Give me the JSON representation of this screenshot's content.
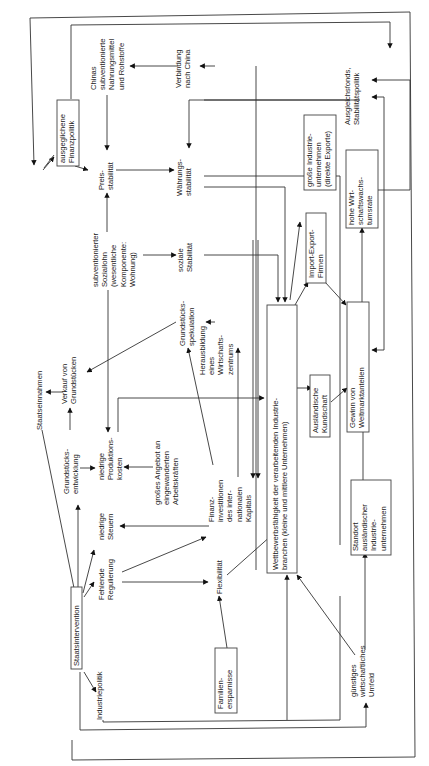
{
  "diagram": {
    "orientation": "rotated-90-ccw",
    "nodes": {
      "staatsintervention": [
        "Staatsintervention"
      ],
      "industriepolitik": [
        "Industriepolitik"
      ],
      "fehlende_regulierung": [
        "Fehlende",
        "Regulierung"
      ],
      "niedrige_steuern": [
        "niedrige",
        "Steuern"
      ],
      "grundstuecksentwicklung": [
        "Grundstücks-",
        "entwicklung"
      ],
      "staatseinnahmen": [
        "Staatseinnahmen"
      ],
      "verkauf_grundstuecke": [
        "Verkauf von",
        "Grundstücken"
      ],
      "niedrige_produktionskosten": [
        "niedrige",
        "Produktions-",
        "kosten"
      ],
      "ausgeglichene_finanzpolitik": [
        "ausgeglichene",
        "Finanzpolitik"
      ],
      "chinas_subventioniert": [
        "Chinas",
        "subventionierte",
        "Nahrungsmittel",
        "und Rohstoffe"
      ],
      "preisstabilitaet": [
        "Preis-",
        "stabilität"
      ],
      "subventionierter_soziallohn": [
        "subventionierter",
        "Soziallohn",
        "(wesentliche",
        "Komponente:",
        "Wohnung)"
      ],
      "grosses_angebot": [
        "großes Angebot an",
        "eingewanderten",
        "Arbeitskräften"
      ],
      "familienersparnisse": [
        "Familien-",
        "ersparnisse"
      ],
      "flexibilitaet": [
        "Flexibilität"
      ],
      "finanzinvestitionen": [
        "Finanz-",
        "investitionen",
        "des inter-",
        "nationalen",
        "Kapitals"
      ],
      "grundstuecksspekulation": [
        "Grundstücks-",
        "spekulation"
      ],
      "herausbildung": [
        "Herausbildung",
        "eines",
        "Wirtschafts-",
        "zentrums"
      ],
      "soziale_stabilitaet": [
        "soziale",
        "Stabilität"
      ],
      "verbindung_china": [
        "Verbindung",
        "nach China"
      ],
      "waehrungsstabilitaet": [
        "Währungs-",
        "stabilität"
      ],
      "wettbewerbsfaehigkeit": [
        "Wettbewerbsfähigkeit der verarbeitenden Industrie-",
        "branchen (kleine und mittlere Unternehmen)"
      ],
      "auslaendische_kundschaft": [
        "Ausländische",
        "Kundschaft"
      ],
      "import_export": [
        "Import-Export-",
        "Firmen"
      ],
      "grosse_industrie": [
        "große Industrie-",
        "unternehmen",
        "(direkte Exporte)"
      ],
      "gewinn_weltmarkt": [
        "Gewinn von",
        "Weltmarktanteilen"
      ],
      "hohe_wachstumsrate": [
        "hohe Wirt-",
        "schaftswachs-",
        "tumsrate"
      ],
      "ausgleichsfonds": [
        "Ausgleichsfonds,",
        "Stabilitätspolitik"
      ],
      "standort_auslaendisch": [
        "Standort",
        "ausländischer",
        "Industrie-",
        "unternehmen"
      ],
      "guenstiges_umfeld": [
        "günstiges",
        "wirtschaftliches",
        "Umfeld"
      ]
    }
  }
}
